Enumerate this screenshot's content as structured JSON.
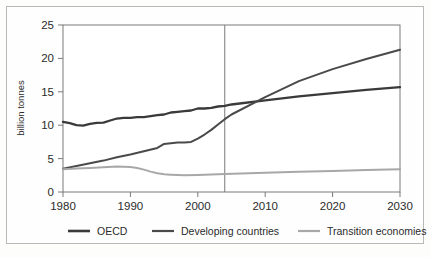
{
  "chart_data": {
    "type": "line",
    "title": "",
    "xlabel": "",
    "ylabel": "billion tonnes",
    "xlim": [
      1980,
      2030
    ],
    "ylim": [
      0,
      25
    ],
    "ytick_labels": [
      "0",
      "5",
      "10",
      "15",
      "20",
      "25"
    ],
    "ytick_values": [
      0,
      5,
      10,
      15,
      20,
      25
    ],
    "xtick_labels": [
      "1980",
      "1990",
      "2000",
      "2010",
      "2020",
      "2030"
    ],
    "xtick_values": [
      1980,
      1990,
      2000,
      2010,
      2020,
      2030
    ],
    "grid": false,
    "legend_position": "bottom",
    "annotations": [
      {
        "name": "projection-divider",
        "type": "vline",
        "x": 2004,
        "label": ""
      }
    ],
    "series": [
      {
        "name": "OECD",
        "color": "#3a3a3a",
        "width": 2.3,
        "x": [
          1980,
          1981,
          1982,
          1983,
          1984,
          1985,
          1986,
          1987,
          1988,
          1989,
          1990,
          1991,
          1992,
          1993,
          1994,
          1995,
          1996,
          1997,
          1998,
          1999,
          2000,
          2001,
          2002,
          2003,
          2004,
          2005,
          2010,
          2015,
          2020,
          2025,
          2030
        ],
        "values": [
          10.5,
          10.3,
          10.0,
          9.95,
          10.2,
          10.35,
          10.4,
          10.7,
          11.0,
          11.1,
          11.1,
          11.2,
          11.2,
          11.35,
          11.5,
          11.6,
          11.9,
          12.0,
          12.1,
          12.2,
          12.5,
          12.5,
          12.6,
          12.8,
          12.9,
          13.1,
          13.7,
          14.3,
          14.8,
          15.3,
          15.7
        ]
      },
      {
        "name": "Developing countries",
        "color": "#4a4a4a",
        "width": 2.0,
        "x": [
          1980,
          1982,
          1984,
          1986,
          1988,
          1990,
          1992,
          1994,
          1995,
          1996,
          1997,
          1998,
          1999,
          2000,
          2001,
          2002,
          2003,
          2004,
          2005,
          2010,
          2015,
          2020,
          2025,
          2030
        ],
        "values": [
          3.5,
          3.9,
          4.3,
          4.7,
          5.2,
          5.6,
          6.1,
          6.6,
          7.2,
          7.3,
          7.4,
          7.4,
          7.5,
          8.0,
          8.6,
          9.3,
          10.1,
          10.9,
          11.6,
          14.2,
          16.6,
          18.4,
          19.9,
          21.3
        ]
      },
      {
        "name": "Transition economies",
        "color": "#a8a8a8",
        "width": 2.0,
        "x": [
          1980,
          1982,
          1984,
          1986,
          1988,
          1990,
          1991,
          1992,
          1993,
          1994,
          1995,
          1996,
          1997,
          1998,
          2000,
          2004,
          2010,
          2015,
          2020,
          2025,
          2030
        ],
        "values": [
          3.4,
          3.5,
          3.6,
          3.7,
          3.8,
          3.75,
          3.6,
          3.35,
          3.05,
          2.8,
          2.65,
          2.6,
          2.55,
          2.5,
          2.55,
          2.7,
          2.9,
          3.05,
          3.15,
          3.3,
          3.4
        ]
      }
    ],
    "legend": [
      {
        "label": "OECD",
        "color": "#3a3a3a",
        "width": 2.6
      },
      {
        "label": "Developing countries",
        "color": "#4a4a4a",
        "width": 2.2
      },
      {
        "label": "Transition economies",
        "color": "#a8a8a8",
        "width": 2.2
      }
    ]
  },
  "colors": {
    "plot_border": "#7a7a78",
    "outer_frame": "#b9b9b6",
    "text": "#2b2b2b",
    "background": "#fefefe"
  }
}
